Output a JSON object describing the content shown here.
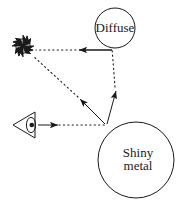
{
  "figure": {
    "type": "ray-tracing-light-transport-diagram",
    "background": "#ffffff",
    "stroke_color": "#1a1a1a",
    "canvas": {
      "width": 186,
      "height": 201
    }
  },
  "labels": {
    "diffuse": "Diffuse",
    "shiny_line1": "Shiny",
    "shiny_line2": "metal"
  },
  "objects": [
    {
      "name": "light-source-sun",
      "icon": "sun-icon",
      "cx": 23,
      "cy": 46,
      "r": 9
    },
    {
      "name": "camera-eye",
      "icon": "eye-icon",
      "cx": 26,
      "cy": 125
    },
    {
      "name": "diffuse-sphere",
      "cx": 115,
      "cy": 28,
      "r": 20
    },
    {
      "name": "shiny-metal-sphere",
      "cx": 136,
      "cy": 160,
      "r": 38
    }
  ],
  "rays": [
    {
      "name": "ray-eye-to-metal",
      "from": "camera-eye",
      "to": "shiny-metal-sphere",
      "solid_head": true,
      "dotted_tail": true
    },
    {
      "name": "ray-metal-to-light",
      "from": "shiny-metal-sphere",
      "to": "light-source-sun",
      "solid_head": true,
      "dotted_tail": true
    },
    {
      "name": "ray-metal-to-diffuse",
      "from": "shiny-metal-sphere",
      "to": "diffuse-sphere",
      "solid_head": true,
      "dotted_tail": true
    },
    {
      "name": "ray-diffuse-to-light",
      "from": "diffuse-sphere",
      "to": "light-source-sun",
      "solid_head": true,
      "dotted_tail": true
    }
  ]
}
